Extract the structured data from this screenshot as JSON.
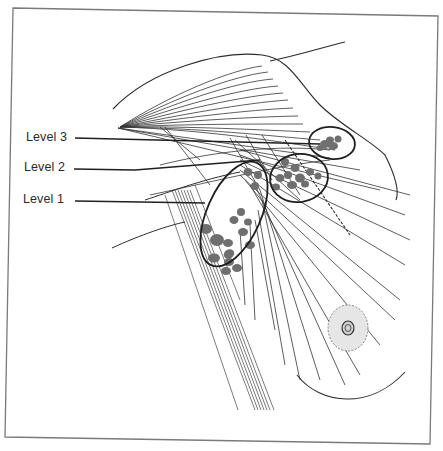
{
  "diagram": {
    "labels": [
      {
        "id": "level-3",
        "text": "Level 3",
        "x": 26,
        "y": 130
      },
      {
        "id": "level-2",
        "text": "Level 2",
        "x": 24,
        "y": 160
      },
      {
        "id": "level-1",
        "text": "Level 1",
        "x": 23,
        "y": 192
      }
    ],
    "colors": {
      "line": "#2b2b2b",
      "node_fill": "#6f6f6f",
      "frame": "#7a7a7a",
      "areola_fill": "#e6e6e6",
      "background": "#ffffff"
    }
  }
}
